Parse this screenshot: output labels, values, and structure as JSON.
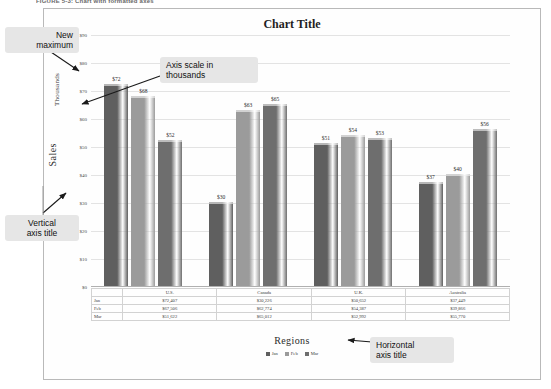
{
  "figure": {
    "caption": "FIGURE 5-3: Chart with formatted axes"
  },
  "chart": {
    "title": "Chart Title",
    "vertical_axis_title": "Sales",
    "axis_units_label": "Thousands",
    "horizontal_axis_title": "Regions"
  },
  "callouts": [
    {
      "id": "new-maximum",
      "text": "New\nmaximum"
    },
    {
      "id": "axis-scale",
      "text": "Axis scale in\nthousands"
    },
    {
      "id": "vertical-axis",
      "text": "Vertical\naxis title"
    },
    {
      "id": "horizontal-axis",
      "text": "Horizontal\naxis title"
    }
  ],
  "colors": {
    "series_jan": "#5f5f5f",
    "series_feb": "#9b9b9b",
    "series_mar": "#6e6e6e",
    "gridline": "#e3e3e3",
    "frame": "#b9b9b9",
    "callout_bg": "#e6e6e6"
  },
  "chart_data": {
    "type": "bar",
    "title": "Chart Title",
    "xlabel": "Regions",
    "ylabel": "Sales",
    "yunits": "Thousands",
    "ylim": [
      0,
      90
    ],
    "ytick_labels": [
      "$90",
      "$80",
      "$70",
      "$60",
      "$50",
      "$40",
      "$30",
      "$20",
      "$10",
      "$0"
    ],
    "ytick_values": [
      90,
      80,
      70,
      60,
      50,
      40,
      30,
      20,
      10,
      0
    ],
    "grid": true,
    "legend_position": "bottom",
    "categories": [
      "U.S.",
      "Canada",
      "U.K.",
      "Australia"
    ],
    "series": [
      {
        "name": "Jan",
        "color": "#5f5f5f",
        "values": [
          72,
          30,
          51,
          37
        ],
        "data_labels": [
          "$72",
          "$30",
          "$51",
          "$37"
        ],
        "table_values": [
          "$72,407",
          "$30,226",
          "$50,652",
          "$37,449"
        ]
      },
      {
        "name": "Feb",
        "color": "#9b9b9b",
        "values": [
          68,
          63,
          54,
          40
        ],
        "data_labels": [
          "$68",
          "$63",
          "$54",
          "$40"
        ],
        "table_values": [
          "$67,506",
          "$62,774",
          "$54,387",
          "$39,866"
        ]
      },
      {
        "name": "Mar",
        "color": "#6e6e6e",
        "values": [
          52,
          65,
          53,
          56
        ],
        "data_labels": [
          "$52",
          "$65",
          "$53",
          "$56"
        ],
        "table_values": [
          "$51,622",
          "$65,012",
          "$52,992",
          "$55,770"
        ]
      }
    ]
  },
  "data_table": {
    "row_headers": [
      "Jan",
      "Feb",
      "Mar"
    ],
    "column_headers": [
      "U.S.",
      "Canada",
      "U.K.",
      "Australia"
    ],
    "rows": [
      [
        "$72,407",
        "$30,226",
        "$50,652",
        "$37,449"
      ],
      [
        "$67,506",
        "$62,774",
        "$54,387",
        "$39,866"
      ],
      [
        "$51,622",
        "$65,012",
        "$52,992",
        "$55,770"
      ]
    ]
  },
  "legend": {
    "items": [
      {
        "label": "Jan",
        "color": "#5f5f5f"
      },
      {
        "label": "Feb",
        "color": "#9b9b9b"
      },
      {
        "label": "Mar",
        "color": "#6e6e6e"
      }
    ]
  }
}
